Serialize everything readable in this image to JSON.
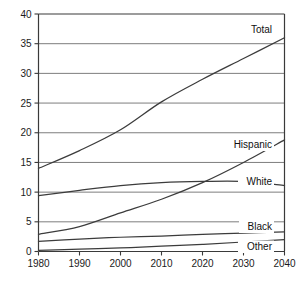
{
  "chart_data": {
    "type": "line",
    "title": "",
    "subtitle": "",
    "xlabel": "",
    "ylabel": "",
    "xlim": [
      1980,
      2040
    ],
    "ylim": [
      0,
      40
    ],
    "grid": "horizontal",
    "legend_position": "inline-right-of-line",
    "x_ticks": [
      1980,
      1990,
      2000,
      2010,
      2020,
      2030,
      2040
    ],
    "y_ticks": [
      0,
      5,
      10,
      15,
      20,
      25,
      30,
      35,
      40
    ],
    "x": [
      1980,
      1990,
      2000,
      2010,
      2020,
      2030,
      2040
    ],
    "series": [
      {
        "name": "Total",
        "label": "Total",
        "values": [
          14.0,
          17.0,
          20.5,
          25.2,
          29.0,
          32.5,
          36.0
        ]
      },
      {
        "name": "White",
        "label": "White",
        "values": [
          9.4,
          10.3,
          11.1,
          11.6,
          11.8,
          11.8,
          11.1
        ]
      },
      {
        "name": "Hispanic",
        "label": "Hispanic",
        "values": [
          2.9,
          4.2,
          6.5,
          8.8,
          11.6,
          15.0,
          18.8
        ]
      },
      {
        "name": "Black",
        "label": "Black",
        "values": [
          1.7,
          2.1,
          2.4,
          2.6,
          2.9,
          3.1,
          3.3
        ]
      },
      {
        "name": "Other",
        "label": "Other",
        "values": [
          0.2,
          0.4,
          0.6,
          0.9,
          1.2,
          1.6,
          2.0
        ]
      }
    ]
  },
  "axes": {
    "y_tick_labels": [
      "0",
      "5",
      "10",
      "15",
      "20",
      "25",
      "30",
      "35",
      "40"
    ],
    "x_tick_labels": [
      "1980",
      "1990",
      "2000",
      "2010",
      "2020",
      "2030",
      "2040"
    ]
  },
  "series_labels": {
    "total": "Total",
    "hispanic": "Hispanic",
    "white": "White",
    "black": "Black",
    "other": "Other"
  },
  "colors": {
    "line": "#3c3c3c",
    "grid": "#6e6e6e",
    "axis": "#3a3a3a",
    "text": "#1b1b1b",
    "background": "#ffffff"
  }
}
